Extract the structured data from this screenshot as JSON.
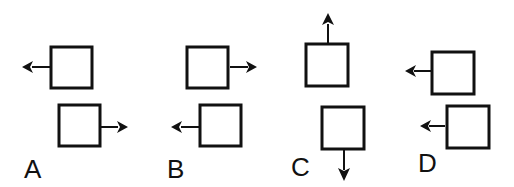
{
  "figure": {
    "options": [
      {
        "label": "A",
        "squares": [
          {
            "x": 51,
            "y": 47,
            "size": 41,
            "arrow": "left"
          },
          {
            "x": 59,
            "y": 105,
            "size": 41,
            "arrow": "right"
          }
        ]
      },
      {
        "label": "B",
        "squares": [
          {
            "x": 187,
            "y": 47,
            "size": 41,
            "arrow": "right"
          },
          {
            "x": 200,
            "y": 105,
            "size": 41,
            "arrow": "left"
          }
        ]
      },
      {
        "label": "C",
        "squares": [
          {
            "x": 306,
            "y": 44,
            "size": 42,
            "arrow": "up"
          },
          {
            "x": 322,
            "y": 107,
            "size": 42,
            "arrow": "down"
          }
        ]
      },
      {
        "label": "D",
        "squares": [
          {
            "x": 432,
            "y": 52,
            "size": 42,
            "arrow": "left"
          },
          {
            "x": 447,
            "y": 106,
            "size": 42,
            "arrow": "left"
          }
        ]
      }
    ],
    "colors": {
      "stroke": "#111111",
      "background": "#ffffff"
    }
  }
}
